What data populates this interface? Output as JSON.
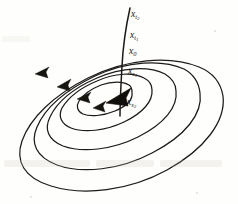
{
  "figure": {
    "background_color": "#fefefc",
    "ink_color": "#1d1b19",
    "width": 238,
    "height": 204
  },
  "labels": [
    {
      "id": "x-t2",
      "base": "x",
      "sub": "t",
      "subsub": "2",
      "x": 131,
      "y": 15,
      "name": "point-label-x-t2"
    },
    {
      "id": "x-t1",
      "base": "x",
      "sub": "t",
      "subsub": "1",
      "x": 130,
      "y": 36,
      "name": "point-label-x-t1"
    },
    {
      "id": "x-0",
      "base": "x",
      "sub": "0",
      "subsub": "",
      "x": 129,
      "y": 52,
      "name": "point-label-x-0"
    },
    {
      "id": "x-s1",
      "base": "x",
      "sub": "s",
      "subsub": "1",
      "x": 128,
      "y": 72,
      "name": "point-label-x-s1"
    },
    {
      "id": "x-s2",
      "base": "x",
      "sub": "s",
      "subsub": "2",
      "x": 127,
      "y": 103,
      "name": "point-label-x-s2"
    }
  ],
  "orbits": [
    {
      "id": "orbit-1",
      "name": "orbit-outermost",
      "rx": 104,
      "ry": 52,
      "cx": 122,
      "cy": 118,
      "rotation": -19
    },
    {
      "id": "orbit-2",
      "name": "orbit-second",
      "rx": 82,
      "ry": 41,
      "cx": 120,
      "cy": 111,
      "rotation": -19
    },
    {
      "id": "orbit-3",
      "name": "orbit-third",
      "rx": 60,
      "ry": 30,
      "cx": 118,
      "cy": 105,
      "rotation": -19
    },
    {
      "id": "orbit-4",
      "name": "orbit-fourth",
      "rx": 38,
      "ry": 19,
      "cx": 116,
      "cy": 100,
      "rotation": -19
    },
    {
      "id": "orbit-5",
      "name": "orbit-innermost",
      "rx": 19,
      "ry": 10,
      "cx": 114,
      "cy": 97,
      "rotation": -19
    }
  ],
  "arrows": [
    {
      "id": "arrow-1",
      "name": "flow-arrow-outer",
      "x": 38,
      "y": 72,
      "angle": 205
    },
    {
      "id": "arrow-2",
      "name": "flow-arrow-second",
      "x": 60,
      "y": 84,
      "angle": 208
    },
    {
      "id": "arrow-3",
      "name": "flow-arrow-third",
      "x": 80,
      "y": 96,
      "angle": 210
    },
    {
      "id": "arrow-4",
      "name": "flow-arrow-fourth",
      "x": 96,
      "y": 106,
      "angle": 212
    },
    {
      "id": "arrow-center",
      "name": "flow-arrow-center-bold",
      "x": 112,
      "y": 100,
      "angle": 208
    }
  ],
  "transversal": {
    "name": "transversal-section-curve",
    "description": "curve crossing successive orbits through labelled points",
    "start_x": 130,
    "start_y": 8,
    "end_x": 120,
    "end_y": 116
  }
}
